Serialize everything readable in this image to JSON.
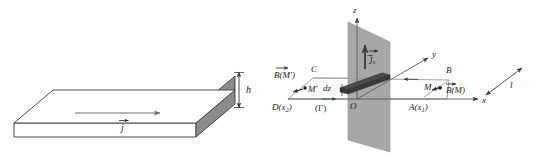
{
  "figure": {
    "panels": [
      {
        "id": "left-panel",
        "name": "slab-panel",
        "description": "3D perspective view of a thin conducting slab of thickness h carrying volume current density j",
        "labels": {
          "thickness": "h",
          "current_density": "j",
          "current_density_vector": "⃗j"
        },
        "colors": {
          "slab_top": "#ffffff",
          "slab_front": "#ffffff",
          "slab_side": "#8c8c8c",
          "outline": "#333333",
          "arrow": "#555555"
        }
      },
      {
        "id": "right-panel",
        "name": "sheet-panel",
        "description": "Infinite plane sheet in the yOz plane carrying surface current js, with Amperian rectangular contour ABCD",
        "axes": {
          "x": "x",
          "y": "y",
          "z": "z",
          "origin": "O"
        },
        "labels": {
          "surface_current": "⃗j",
          "surface_current_sub": "s",
          "strip_thickness": "dz",
          "point_A": "A(x",
          "point_A_sub": "1",
          "point_A_close": ")",
          "point_B": "B",
          "point_C": "C",
          "point_D": "D(x",
          "point_D_sub": "2",
          "point_D_close": ")",
          "point_M": "M",
          "point_Mprime": "M′",
          "field_at_M": "⃗B(M)",
          "field_at_M_bar": "B(M)",
          "field_at_Mprime_bar": "B(M′)",
          "contour": "(Γ)",
          "length": "l"
        },
        "colors": {
          "plane_fill": "#a8a8a8",
          "plane_edge": "#6f6f6f",
          "strip_fill": "#4a4a4a",
          "strip_edge": "#2a2a2a",
          "axis": "#4a4a4a",
          "contour_line": "#8a8a8a",
          "label": "#1a1a1a"
        }
      }
    ]
  }
}
